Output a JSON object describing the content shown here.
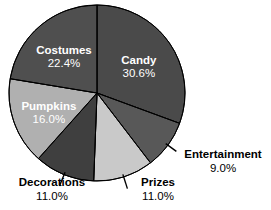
{
  "chart_data": {
    "type": "pie",
    "title": "",
    "subtitle": "",
    "xlabel": "",
    "ylabel": "",
    "legend_position": "none",
    "grid": false,
    "units": "percent",
    "total": 100.0,
    "start_angle_deg": 0,
    "direction": "clockwise",
    "categories": [
      "Candy",
      "Entertainment",
      "Prizes",
      "Decorations",
      "Pumpkins",
      "Costumes"
    ],
    "values": [
      30.6,
      9.0,
      11.0,
      11.0,
      16.0,
      22.4
    ],
    "slices": [
      {
        "label": "Candy",
        "value": 30.6,
        "value_text": "30.6%",
        "color": "#4a4a4a",
        "label_placement": "inside",
        "label_color": "#ffffff"
      },
      {
        "label": "Entertainment",
        "value": 9.0,
        "value_text": "9.0%",
        "color": "#585858",
        "label_placement": "outside",
        "label_color": "#000000"
      },
      {
        "label": "Prizes",
        "value": 11.0,
        "value_text": "11.0%",
        "color": "#c9c9c9",
        "label_placement": "outside",
        "label_color": "#000000"
      },
      {
        "label": "Decorations",
        "value": 11.0,
        "value_text": "11.0%",
        "color": "#3f3f3f",
        "label_placement": "outside",
        "label_color": "#000000"
      },
      {
        "label": "Pumpkins",
        "value": 16.0,
        "value_text": "16.0%",
        "color": "#b0b0b0",
        "label_placement": "inside",
        "label_color": "#ffffff"
      },
      {
        "label": "Costumes",
        "value": 22.4,
        "value_text": "22.4%",
        "color": "#4f4f4f",
        "label_placement": "inside",
        "label_color": "#ffffff"
      }
    ],
    "geometry": {
      "center_x": 97,
      "center_y": 93,
      "radius": 88
    },
    "colors": {
      "background": "#ffffff",
      "outline": "#000000",
      "inside_label": "#ffffff",
      "outside_label": "#000000"
    }
  }
}
